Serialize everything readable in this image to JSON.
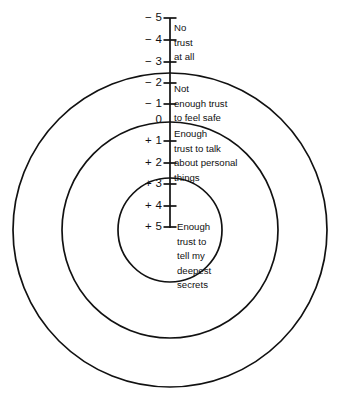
{
  "diagram": {
    "background_color": "#ffffff",
    "stroke_color": "#111111",
    "center": {
      "x": 170,
      "y": 230
    },
    "circles": [
      {
        "name": "outer-circle",
        "radius": 157
      },
      {
        "name": "middle-circle",
        "radius": 108
      },
      {
        "name": "inner-circle",
        "radius": 52
      }
    ],
    "axis": {
      "name": "trust-scale-axis",
      "top_y": 18,
      "bottom_y": 228,
      "x": 170
    },
    "ticks": [
      {
        "label": "− 5",
        "value": -5,
        "y": 18,
        "has_mark": true
      },
      {
        "label": "− 4",
        "value": -4,
        "y": 40,
        "has_mark": true
      },
      {
        "label": "− 3",
        "value": -3,
        "y": 62,
        "has_mark": true
      },
      {
        "label": "− 2",
        "value": -2,
        "y": 83,
        "has_mark": true
      },
      {
        "label": "− 1",
        "value": -1,
        "y": 104,
        "has_mark": true
      },
      {
        "label": "0",
        "value": 0,
        "y": 120,
        "has_mark": false
      },
      {
        "label": "+ 1",
        "value": 1,
        "y": 141,
        "has_mark": true
      },
      {
        "label": "+ 2",
        "value": 2,
        "y": 163,
        "has_mark": true
      },
      {
        "label": "+ 3",
        "value": 3,
        "y": 184,
        "has_mark": true
      },
      {
        "label": "+ 4",
        "value": 4,
        "y": 206,
        "has_mark": true
      },
      {
        "label": "+ 5",
        "value": 5,
        "y": 227,
        "has_mark": true
      }
    ],
    "annotations": [
      {
        "name": "no-trust-at-all-label",
        "zone": "outermost-ring",
        "x": 174,
        "y": 21,
        "lines": [
          "No",
          "trust",
          "at all"
        ]
      },
      {
        "name": "not-enough-trust-label",
        "zone": "second-ring",
        "x": 174,
        "y": 82,
        "lines": [
          "Not",
          "enough trust",
          "to feel safe"
        ]
      },
      {
        "name": "enough-trust-to-talk-label",
        "zone": "third-ring",
        "x": 174,
        "y": 127,
        "lines": [
          "Enough",
          "trust to talk",
          "about personal",
          "things"
        ]
      },
      {
        "name": "deepest-secrets-label",
        "zone": "innermost-circle",
        "x": 177,
        "y": 220,
        "lines": [
          "Enough",
          "trust to",
          "tell my",
          "deepest",
          "secrets"
        ]
      }
    ]
  }
}
